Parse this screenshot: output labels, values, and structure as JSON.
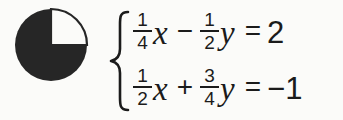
{
  "background_color": "#fbfbf9",
  "ink_color": "#1b1b1b",
  "icon": {
    "name": "pie-quarter-icon",
    "description": "filled circle with upper-right quadrant removed",
    "fill_color": "#262626",
    "cutout_color": "#fbfbf9"
  },
  "system": {
    "brace": "{",
    "equations": [
      {
        "id": "equation-1",
        "text": "1/4 x - 1/2 y = 2",
        "terms": [
          {
            "type": "fraction",
            "numerator": "1",
            "denominator": "4"
          },
          {
            "type": "variable",
            "value": "x"
          },
          {
            "type": "operator",
            "value": "−"
          },
          {
            "type": "fraction",
            "numerator": "1",
            "denominator": "2"
          },
          {
            "type": "variable",
            "value": "y"
          },
          {
            "type": "relation",
            "value": "="
          },
          {
            "type": "number",
            "value": "2"
          }
        ]
      },
      {
        "id": "equation-2",
        "text": "1/2 x + 3/4 y = -1",
        "terms": [
          {
            "type": "fraction",
            "numerator": "1",
            "denominator": "2"
          },
          {
            "type": "variable",
            "value": "x"
          },
          {
            "type": "operator",
            "value": "+"
          },
          {
            "type": "fraction",
            "numerator": "3",
            "denominator": "4"
          },
          {
            "type": "variable",
            "value": "y"
          },
          {
            "type": "relation",
            "value": "="
          },
          {
            "type": "number",
            "value": "−1"
          }
        ]
      }
    ]
  }
}
